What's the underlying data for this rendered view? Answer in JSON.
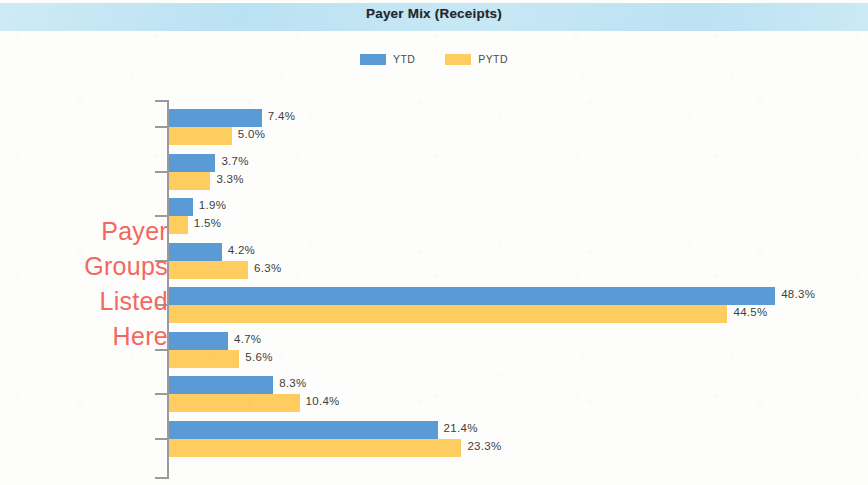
{
  "header": {
    "title": "Payer Mix (Receipts)",
    "band_color": "#b9e1f2"
  },
  "legend": {
    "position": "top-center",
    "entries": [
      {
        "label": "YTD",
        "color": "#5b9bd5",
        "swatch": "legend-swatch-ytd"
      },
      {
        "label": "PYTD",
        "color": "#ffcc60",
        "swatch": "legend-swatch-pytd"
      }
    ]
  },
  "annotation": {
    "color": "#f4675f",
    "lines": [
      "Payer",
      "Groups",
      "Listed",
      "Here"
    ]
  },
  "chart_data": {
    "type": "bar",
    "orientation": "horizontal",
    "title": "Payer Mix (Receipts)",
    "xlabel": "",
    "ylabel": "",
    "grid": false,
    "legend_position": "top-center",
    "value_format": "percent",
    "xlim": [
      0,
      50
    ],
    "categories": [
      "Payer Group 1",
      "Payer Group 2",
      "Payer Group 3",
      "Payer Group 4",
      "Payer Group 5",
      "Payer Group 6",
      "Payer Group 7",
      "Payer Group 8"
    ],
    "category_labels_hidden": true,
    "series": [
      {
        "name": "YTD",
        "color": "#5b9bd5",
        "values": [
          7.4,
          3.7,
          1.9,
          4.2,
          48.3,
          4.7,
          8.3,
          21.4
        ],
        "labels": [
          "7.4%",
          "3.7%",
          "1.9%",
          "4.2%",
          "48.3%",
          "4.7%",
          "8.3%",
          "21.4%"
        ]
      },
      {
        "name": "PYTD",
        "color": "#ffcc60",
        "values": [
          5.0,
          3.3,
          1.5,
          6.3,
          44.5,
          5.6,
          10.4,
          23.3
        ],
        "labels": [
          "5.0%",
          "3.3%",
          "1.5%",
          "6.3%",
          "44.5%",
          "5.6%",
          "10.4%",
          "23.3%"
        ]
      }
    ]
  }
}
